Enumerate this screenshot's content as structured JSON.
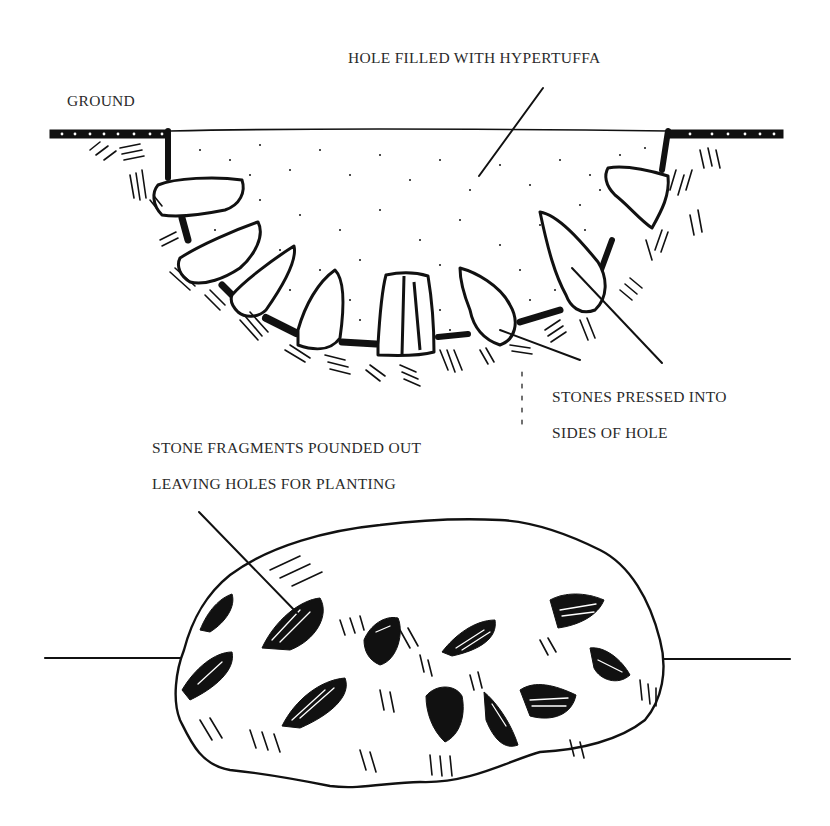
{
  "figure": {
    "top_diagram": {
      "title": "Hole in ground filled with hypertuffa",
      "labels": {
        "ground": "GROUND",
        "hole": "HOLE FILLED WITH HYPERTUFFA",
        "stones_line1": "STONES PRESSED INTO",
        "stones_line2": "SIDES OF HOLE"
      }
    },
    "bottom_diagram": {
      "title": "Finished hypertuffa stone",
      "labels": {
        "fragments_line1": "STONE FRAGMENTS POUNDED OUT",
        "fragments_line2": "LEAVING HOLES FOR PLANTING"
      }
    },
    "colors": {
      "ink": "#111111",
      "text": "#2a2a2a",
      "background": "#ffffff"
    }
  }
}
